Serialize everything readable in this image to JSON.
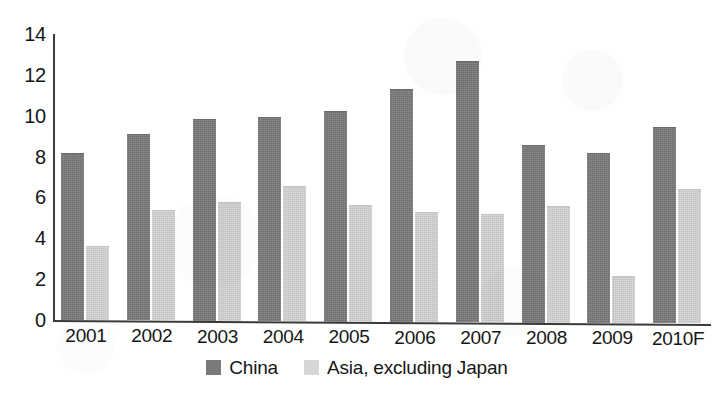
{
  "chart_data": {
    "type": "bar",
    "title": "",
    "subtitle": "",
    "xlabel": "",
    "ylabel": "",
    "categories": [
      "2001",
      "2002",
      "2003",
      "2004",
      "2005",
      "2006",
      "2007",
      "2008",
      "2009",
      "2010F"
    ],
    "series": [
      {
        "name": "China",
        "color": "#7a7a7a",
        "values": [
          8.2,
          9.1,
          9.9,
          10.0,
          10.3,
          11.4,
          12.8,
          8.7,
          8.3,
          9.6
        ]
      },
      {
        "name": "Asia, excluding Japan",
        "color": "#d6d6d6",
        "values": [
          3.6,
          5.4,
          5.8,
          6.6,
          5.7,
          5.4,
          5.3,
          5.7,
          2.3,
          6.6
        ]
      }
    ],
    "ylim": [
      0,
      14
    ],
    "ytick_values": [
      0,
      2,
      4,
      6,
      8,
      10,
      12,
      14
    ],
    "ytick_labels": [
      "0",
      "2",
      "4",
      "6",
      "8",
      "10",
      "12",
      "14"
    ],
    "grid": false,
    "legend_position": "bottom-center",
    "annotations": []
  },
  "legend": {
    "entries": [
      {
        "label": "China",
        "swatch": "series-china"
      },
      {
        "label": "Asia, excluding Japan",
        "swatch": "series-asia"
      }
    ]
  },
  "axes": {
    "y_axis_name": "y-axis",
    "x_axis_name": "x-axis"
  }
}
